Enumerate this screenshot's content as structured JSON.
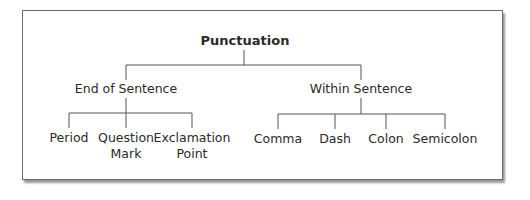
{
  "diagram": {
    "root": "Punctuation",
    "branches": [
      {
        "label": "End of Sentence",
        "leaves": [
          {
            "line1": "Period",
            "line2": ""
          },
          {
            "line1": "Question",
            "line2": "Mark"
          },
          {
            "line1": "Exclamation",
            "line2": "Point"
          }
        ]
      },
      {
        "label": "Within Sentence",
        "leaves": [
          {
            "line1": "Comma",
            "line2": ""
          },
          {
            "line1": "Dash",
            "line2": ""
          },
          {
            "line1": "Colon",
            "line2": ""
          },
          {
            "line1": "Semicolon",
            "line2": ""
          }
        ]
      }
    ],
    "colors": {
      "line": "#555555",
      "text": "#2a2a2a",
      "border": "#6b6b6b"
    }
  }
}
